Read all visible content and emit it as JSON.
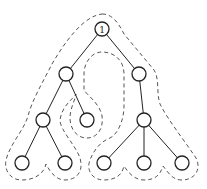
{
  "diagram": {
    "type": "tree-traversal",
    "root_label": "1",
    "colors": {
      "stroke": "#222222",
      "dash": "#555555",
      "bg": "#ffffff"
    },
    "nodes": [
      {
        "id": "n1",
        "label": "1",
        "x": 102,
        "y": 29
      },
      {
        "id": "n2",
        "label": "",
        "x": 66,
        "y": 74
      },
      {
        "id": "n3",
        "label": "",
        "x": 139,
        "y": 74
      },
      {
        "id": "n4",
        "label": "",
        "x": 43,
        "y": 120
      },
      {
        "id": "n5",
        "label": "",
        "x": 87,
        "y": 120
      },
      {
        "id": "n6",
        "label": "",
        "x": 144,
        "y": 120
      },
      {
        "id": "n7",
        "label": "",
        "x": 22,
        "y": 163
      },
      {
        "id": "n8",
        "label": "",
        "x": 65,
        "y": 163
      },
      {
        "id": "n9",
        "label": "",
        "x": 104,
        "y": 163
      },
      {
        "id": "n10",
        "label": "",
        "x": 144,
        "y": 163
      },
      {
        "id": "n11",
        "label": "",
        "x": 182,
        "y": 163
      }
    ],
    "edges": [
      [
        "n1",
        "n2"
      ],
      [
        "n1",
        "n3"
      ],
      [
        "n2",
        "n4"
      ],
      [
        "n2",
        "n5"
      ],
      [
        "n3",
        "n6"
      ],
      [
        "n4",
        "n7"
      ],
      [
        "n4",
        "n8"
      ],
      [
        "n6",
        "n9"
      ],
      [
        "n6",
        "n10"
      ],
      [
        "n6",
        "n11"
      ]
    ]
  }
}
